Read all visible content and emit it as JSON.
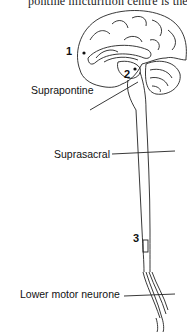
{
  "header": {
    "text": "pontine micturition centre is the"
  },
  "diagram": {
    "labels": {
      "suprapontine": "Suprapontine",
      "suprasacral": "Suprasacral",
      "lower_motor_neurone": "Lower motor neurone"
    },
    "markers": [
      "1",
      "2",
      "3"
    ],
    "colors": {
      "line": "#222222",
      "background": "#ffffff"
    }
  }
}
